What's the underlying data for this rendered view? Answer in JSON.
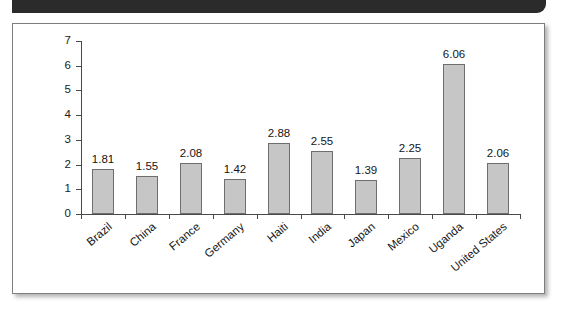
{
  "figure": {
    "header_band_color": "#2b2b2b",
    "frame_border_color": "#7e7e7e",
    "background_color": "#ffffff"
  },
  "chart_data": {
    "type": "bar",
    "title": "",
    "subtitle": "",
    "xlabel": "",
    "ylabel": "",
    "categories": [
      "Brazil",
      "China",
      "France",
      "Germany",
      "Haiti",
      "India",
      "Japan",
      "Mexico",
      "Uganda",
      "United States"
    ],
    "values": [
      1.81,
      1.55,
      2.08,
      1.42,
      2.88,
      2.55,
      1.39,
      2.25,
      6.06,
      2.06
    ],
    "data_labels": [
      "1.81",
      "1.55",
      "2.08",
      "1.42",
      "2.88",
      "2.55",
      "1.39",
      "2.25",
      "6.06",
      "2.06"
    ],
    "ylim": [
      0,
      7
    ],
    "ytick_labels": [
      "7",
      "6",
      "5",
      "4",
      "3",
      "2",
      "1",
      "0"
    ],
    "ytick_values": [
      7,
      6,
      5,
      4,
      3,
      2,
      1,
      0
    ],
    "grid": false,
    "legend": null,
    "bar_fill_color": "#c6c6c6",
    "bar_edge_color": "#6e6e6e",
    "axis_color": "#4a4a4a",
    "label_rotation_deg": -40
  }
}
